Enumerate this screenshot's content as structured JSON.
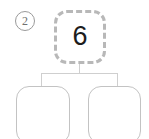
{
  "diagram": {
    "type": "number-bond-tree",
    "step_marker": {
      "label": "2",
      "shape": "circle"
    },
    "nodes": {
      "parent": {
        "value": "6",
        "border_style": "dashed",
        "border_color": "#b8b8b8",
        "filled": true
      },
      "children": [
        {
          "name": "left-child",
          "value": "",
          "border_style": "solid",
          "border_color": "#c3c3c3",
          "filled": false
        },
        {
          "name": "right-child",
          "value": "",
          "border_style": "solid",
          "border_color": "#c3c3c3",
          "filled": false
        }
      ]
    },
    "connector": {
      "color": "#cfcfcf",
      "style": "bracket"
    },
    "background": "#ffffff"
  }
}
